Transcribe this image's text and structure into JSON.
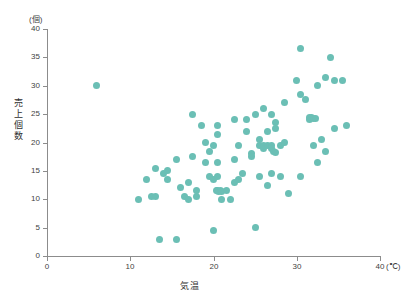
{
  "chart_data": {
    "type": "scatter",
    "title": "",
    "xlabel": "気温",
    "ylabel": "売上個数",
    "x_unit": "(℃)",
    "y_unit": "(個)",
    "xlim": [
      0,
      40
    ],
    "ylim": [
      0,
      40
    ],
    "xticks": [
      0,
      10,
      20,
      30,
      40
    ],
    "yticks": [
      0,
      5,
      10,
      15,
      20,
      25,
      30,
      35,
      40
    ],
    "grid": false,
    "legend": null,
    "marker_color": "#6bbfb5",
    "marker_size": 7,
    "points": [
      [
        6.0,
        30.0
      ],
      [
        11.0,
        10.0
      ],
      [
        12.5,
        10.5
      ],
      [
        13.0,
        10.5
      ],
      [
        13.5,
        3.0
      ],
      [
        15.5,
        3.0
      ],
      [
        13.0,
        15.5
      ],
      [
        12.0,
        13.5
      ],
      [
        14.0,
        14.5
      ],
      [
        14.5,
        15.0
      ],
      [
        14.5,
        13.5
      ],
      [
        15.5,
        17.0
      ],
      [
        16.0,
        12.0
      ],
      [
        16.5,
        10.5
      ],
      [
        17.0,
        10.0
      ],
      [
        17.0,
        13.0
      ],
      [
        17.5,
        25.0
      ],
      [
        17.5,
        17.5
      ],
      [
        18.0,
        11.5
      ],
      [
        18.0,
        10.5
      ],
      [
        18.5,
        23.0
      ],
      [
        19.0,
        16.5
      ],
      [
        19.0,
        20.0
      ],
      [
        19.5,
        14.0
      ],
      [
        19.5,
        18.5
      ],
      [
        20.0,
        19.5
      ],
      [
        20.0,
        13.5
      ],
      [
        20.0,
        4.5
      ],
      [
        20.3,
        11.5
      ],
      [
        20.5,
        11.5
      ],
      [
        20.6,
        11.3
      ],
      [
        20.8,
        11.6
      ],
      [
        21.0,
        11.4
      ],
      [
        20.5,
        14.0
      ],
      [
        20.5,
        16.5
      ],
      [
        20.5,
        21.5
      ],
      [
        20.5,
        23.0
      ],
      [
        21.0,
        10.0
      ],
      [
        21.5,
        11.5
      ],
      [
        22.0,
        10.0
      ],
      [
        22.5,
        17.0
      ],
      [
        22.5,
        13.0
      ],
      [
        22.5,
        24.0
      ],
      [
        23.0,
        19.5
      ],
      [
        23.0,
        13.5
      ],
      [
        23.5,
        14.5
      ],
      [
        24.0,
        22.0
      ],
      [
        24.0,
        24.0
      ],
      [
        24.5,
        18.0
      ],
      [
        24.5,
        17.5
      ],
      [
        25.0,
        5.0
      ],
      [
        25.0,
        25.0
      ],
      [
        25.5,
        20.5
      ],
      [
        25.5,
        19.5
      ],
      [
        25.5,
        14.0
      ],
      [
        26.0,
        26.0
      ],
      [
        26.0,
        19.5
      ],
      [
        26.0,
        19.0
      ],
      [
        26.5,
        19.5
      ],
      [
        26.5,
        22.0
      ],
      [
        26.5,
        12.5
      ],
      [
        27.0,
        25.0
      ],
      [
        27.0,
        19.5
      ],
      [
        27.0,
        19.0
      ],
      [
        27.2,
        18.5
      ],
      [
        27.5,
        18.3
      ],
      [
        27.0,
        14.5
      ],
      [
        27.5,
        22.5
      ],
      [
        27.5,
        23.5
      ],
      [
        28.0,
        19.5
      ],
      [
        28.0,
        14.0
      ],
      [
        28.5,
        27.0
      ],
      [
        28.5,
        20.0
      ],
      [
        29.0,
        11.0
      ],
      [
        30.0,
        31.0
      ],
      [
        30.5,
        36.5
      ],
      [
        30.5,
        28.5
      ],
      [
        30.5,
        14.0
      ],
      [
        31.0,
        27.5
      ],
      [
        31.5,
        24.5
      ],
      [
        31.5,
        24.0
      ],
      [
        31.8,
        24.5
      ],
      [
        32.0,
        24.3
      ],
      [
        32.0,
        19.5
      ],
      [
        32.3,
        24.2
      ],
      [
        32.5,
        30.0
      ],
      [
        32.5,
        16.5
      ],
      [
        33.0,
        20.5
      ],
      [
        33.5,
        31.5
      ],
      [
        33.5,
        18.5
      ],
      [
        34.0,
        35.0
      ],
      [
        34.5,
        31.0
      ],
      [
        34.5,
        22.5
      ],
      [
        35.5,
        31.0
      ],
      [
        36.0,
        23.0
      ]
    ]
  },
  "axes": {
    "y_unit_label": "(個)",
    "x_unit_label": "(℃)",
    "y_title": "売上個数",
    "x_title": "気温",
    "y_tick_labels": [
      "40",
      "35",
      "30",
      "25",
      "20",
      "15",
      "10",
      "5",
      "0"
    ],
    "x_tick_labels": [
      "0",
      "10",
      "20",
      "30",
      "40"
    ]
  }
}
